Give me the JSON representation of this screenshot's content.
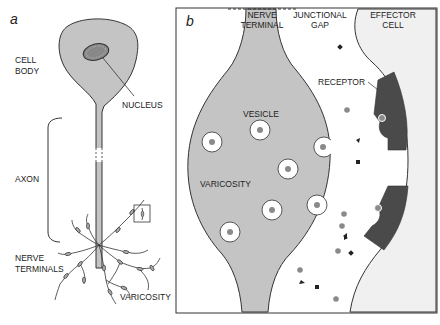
{
  "panel_a": {
    "letter": "a",
    "labels": {
      "cell_body_1": "CELL",
      "cell_body_2": "BODY",
      "nucleus": "NUCLEUS",
      "axon": "AXON",
      "nerve_terminals_1": "NERVE",
      "nerve_terminals_2": "TERMINALS",
      "varicosity": "VARICOSITY"
    }
  },
  "panel_b": {
    "letter": "b",
    "labels": {
      "nerve_terminal_1": "NERVE",
      "nerve_terminal_2": "TERMINAL",
      "junctional_gap_1": "JUNCTIONAL",
      "junctional_gap_2": "GAP",
      "effector_cell_1": "EFFECTOR",
      "effector_cell_2": "CELL",
      "receptor": "RECEPTOR",
      "vesicle": "VESICLE",
      "varicosity": "VARICOSITY"
    }
  },
  "colors": {
    "cell_fill": "#c4c4c4",
    "effector_fill": "#f0f0f0",
    "receptor_fill": "#4a4a4a",
    "transmitter_dot": "#8a8a8a",
    "outline": "#333333"
  }
}
